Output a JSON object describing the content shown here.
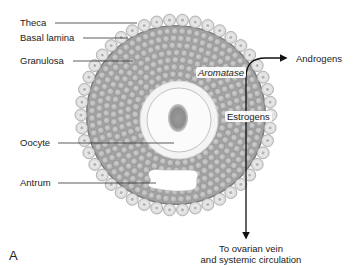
{
  "figure": {
    "panel_label": "A",
    "structure_labels": {
      "theca": "Theca",
      "basal_lamina": "Basal lamina",
      "granulosa": "Granulosa",
      "oocyte": "Oocyte",
      "antrum": "Antrum"
    },
    "pathway": {
      "enzyme": "Aromatase",
      "substrate": "Androgens",
      "product": "Estrogens",
      "destination_line1": "To ovarian vein",
      "destination_line2": "and systemic circulation"
    },
    "colors": {
      "theca_cell": "#e4e4e4",
      "granulosa_fill": "#a9a9a9",
      "granulosa_cell": "#bdbdbd",
      "zona": "#f3f3f3",
      "nucleus": "#8a8a8a",
      "line": "#333333"
    }
  }
}
